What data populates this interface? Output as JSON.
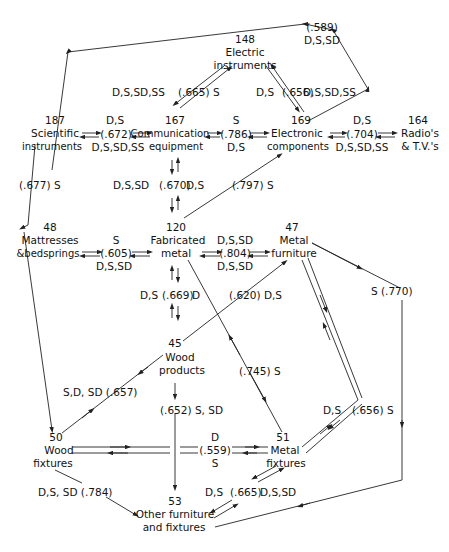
{
  "nodes": {
    "electric_instruments": {
      "code": "148",
      "line1": "Electric",
      "line2": "instruments"
    },
    "scientific_instruments": {
      "code": "187",
      "line1": "Scientific",
      "line2": "instruments"
    },
    "communication_equipment": {
      "code": "167",
      "line1": "Communication",
      "line2": "equipment"
    },
    "electronic_components": {
      "code": "169",
      "line1": "Electronic",
      "line2": "components"
    },
    "radios_tvs": {
      "code": "164",
      "line1": "Radio's",
      "line2": "& T.V.'s"
    },
    "mattresses": {
      "code": "48",
      "line1": "Mattresses",
      "line2": "&bedsprings"
    },
    "fabricated_metal": {
      "code": "120",
      "line1": "Fabricated",
      "line2": "metal"
    },
    "metal_furniture": {
      "code": "47",
      "line1": "Metal",
      "line2": "furniture"
    },
    "wood_products": {
      "code": "45",
      "line1": "Wood",
      "line2": "products"
    },
    "wood_fixtures": {
      "code": "50",
      "line1": "Wood",
      "line2": "fixtures"
    },
    "metal_fixtures": {
      "code": "51",
      "line1": "Metal",
      "line2": "fixtures"
    },
    "other_furniture": {
      "code": "53",
      "line1": "Other furniture",
      "line2": "and fixtures"
    }
  },
  "edges": {
    "e589": {
      "value": "(.589)",
      "tags": "D,S,SD"
    },
    "e665_top": {
      "left": "D,S,SD,SS",
      "value": "(.665) S"
    },
    "e656_top": {
      "left": "D,S",
      "value": "(.656)",
      "right": "D,S,SD,SS"
    },
    "e672": {
      "above": "D,S",
      "value": "(.672)",
      "below": "D,S,SD,SS"
    },
    "e786": {
      "above": "S",
      "value": "(.786)",
      "below": "D,S"
    },
    "e704": {
      "above": "D,S",
      "value": "(.704)",
      "below": "D,S,SD,SS"
    },
    "e677": {
      "value": "(.677) S"
    },
    "e670": {
      "left": "D,S,SD",
      "value": "(.670)",
      "right": "D,S"
    },
    "e797": {
      "value": "(.797) S"
    },
    "e605": {
      "above": "S",
      "value": "(.605)",
      "below": "D,S,SD"
    },
    "e804": {
      "above": "D,S,SD",
      "value": "(.804)",
      "below": "D,S,SD"
    },
    "e669": {
      "left": "D,S",
      "value": "(.669)",
      "right": "D"
    },
    "e620": {
      "value": "(.620) D,S"
    },
    "e770": {
      "value": "S (.770)"
    },
    "e657": {
      "value": "S,D, SD (.657)"
    },
    "e745": {
      "value": "(.745) S"
    },
    "e652": {
      "value": "(.652) S, SD"
    },
    "e656_mid": {
      "left": "D,S",
      "value": "(.656) S"
    },
    "e559": {
      "above": "D",
      "value": "(.559)",
      "below": "S"
    },
    "e784": {
      "value": "D,S, SD (.784)"
    },
    "e665_bot": {
      "left": "D,S",
      "value": "(.665)",
      "right": "D,S,SD"
    }
  }
}
